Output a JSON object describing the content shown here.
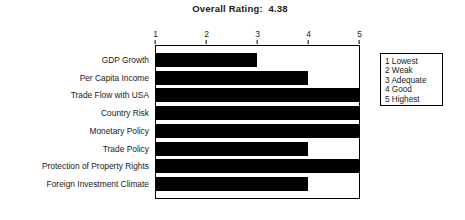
{
  "chart_data": {
    "type": "bar",
    "orientation": "horizontal",
    "title": "Overall Rating:  4.38",
    "overall_rating": "4.38",
    "xlabel": "",
    "ylabel": "",
    "xlim": [
      1,
      5
    ],
    "xticks": [
      "1",
      "2",
      "3",
      "4",
      "5"
    ],
    "grid": false,
    "legend_position": "right-outside",
    "bar_color": "#000000",
    "frame_color": "#000000",
    "background_color": "#ffffff",
    "categories": [
      "GDP Growth",
      "Per Capita Income",
      "Trade Flow with USA",
      "Country Risk",
      "Monetary Policy",
      "Trade Policy",
      "Protection of Property Rights",
      "Foreign Investment Climate"
    ],
    "values": [
      3,
      4,
      5,
      5,
      5,
      4,
      5,
      4
    ],
    "legend_entries": [
      "1 Lowest",
      "2 Weak",
      "3 Adequate",
      "4 Good",
      "5 Highest"
    ]
  }
}
